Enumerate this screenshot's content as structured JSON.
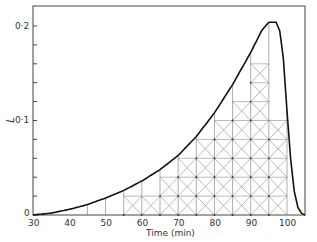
{
  "chart_data": {
    "type": "line",
    "title": "",
    "xlabel": "Time (min)",
    "ylabel": "L",
    "xlim": [
      30,
      105
    ],
    "ylim": [
      0,
      0.22
    ],
    "x_ticks": [
      "30",
      "40",
      "50",
      "60",
      "70",
      "80",
      "90",
      "100"
    ],
    "y_ticks": [
      "0",
      "0·1",
      "0·2"
    ],
    "grid": false,
    "legend": null,
    "annotations": [
      "Cross-hatched lattice grid shading under curve from ~55 to ~100 min"
    ],
    "series": [
      {
        "name": "L",
        "x": [
          30,
          35,
          40,
          45,
          50,
          55,
          60,
          65,
          70,
          75,
          80,
          85,
          90,
          93,
          95,
          97,
          98,
          99,
          100,
          101,
          102,
          103,
          104,
          105
        ],
        "values": [
          0,
          0.002,
          0.006,
          0.011,
          0.018,
          0.026,
          0.036,
          0.048,
          0.063,
          0.083,
          0.108,
          0.138,
          0.172,
          0.195,
          0.204,
          0.204,
          0.195,
          0.165,
          0.11,
          0.06,
          0.025,
          0.008,
          0.002,
          0
        ]
      }
    ]
  },
  "axes": {
    "xlabel": "Time (min)",
    "ylabel": "L",
    "x_ticks": [
      "30",
      "40",
      "50",
      "60",
      "70",
      "80",
      "90",
      "100"
    ],
    "y_ticks": [
      "0",
      "0·1",
      "0·2"
    ]
  }
}
